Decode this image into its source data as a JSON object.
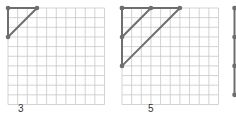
{
  "colors": {
    "grid_line": "#c8c8c8",
    "shape_line": "#6e6e6e",
    "vertex": "#6e6e6e",
    "label": "#333333"
  },
  "figures": [
    {
      "label": "3",
      "grid": {
        "cols": 10,
        "rows": 10
      },
      "triangles": [
        {
          "vertices": [
            [
              0,
              0
            ],
            [
              3,
              0
            ],
            [
              0,
              3
            ]
          ]
        }
      ]
    },
    {
      "label": "5",
      "grid": {
        "cols": 10,
        "rows": 10
      },
      "triangles": [
        {
          "vertices": [
            [
              0,
              0
            ],
            [
              3,
              0
            ],
            [
              0,
              3
            ]
          ]
        },
        {
          "vertices": [
            [
              0,
              0
            ],
            [
              6,
              0
            ],
            [
              0,
              6
            ]
          ]
        }
      ]
    },
    {
      "label": "",
      "partial": true,
      "vertical_line_dots": [
        0,
        3,
        6,
        9
      ]
    }
  ]
}
